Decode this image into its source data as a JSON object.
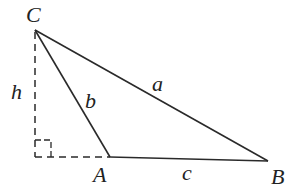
{
  "diagram": {
    "title": "",
    "type": "triangle-with-altitude",
    "colors": {
      "line": "#2a2a2a",
      "text": "#222222",
      "background": "#ffffff"
    },
    "vertices": {
      "C": {
        "label": "C",
        "x": 35,
        "y": 30
      },
      "A": {
        "label": "A",
        "x": 110,
        "y": 157
      },
      "B": {
        "label": "B",
        "x": 268,
        "y": 161
      },
      "H": {
        "label": "",
        "x": 35,
        "y": 157
      }
    },
    "sides": {
      "a": {
        "label": "a",
        "from": "C",
        "to": "B"
      },
      "b": {
        "label": "b",
        "from": "C",
        "to": "A"
      },
      "c": {
        "label": "c",
        "from": "A",
        "to": "B"
      }
    },
    "altitude": {
      "label": "h",
      "from": "C",
      "to": "H",
      "style": "dashed"
    },
    "extension": {
      "from": "H",
      "to": "A",
      "style": "dashed"
    },
    "right_angle_marker": {
      "at": "H",
      "size": 16
    }
  }
}
